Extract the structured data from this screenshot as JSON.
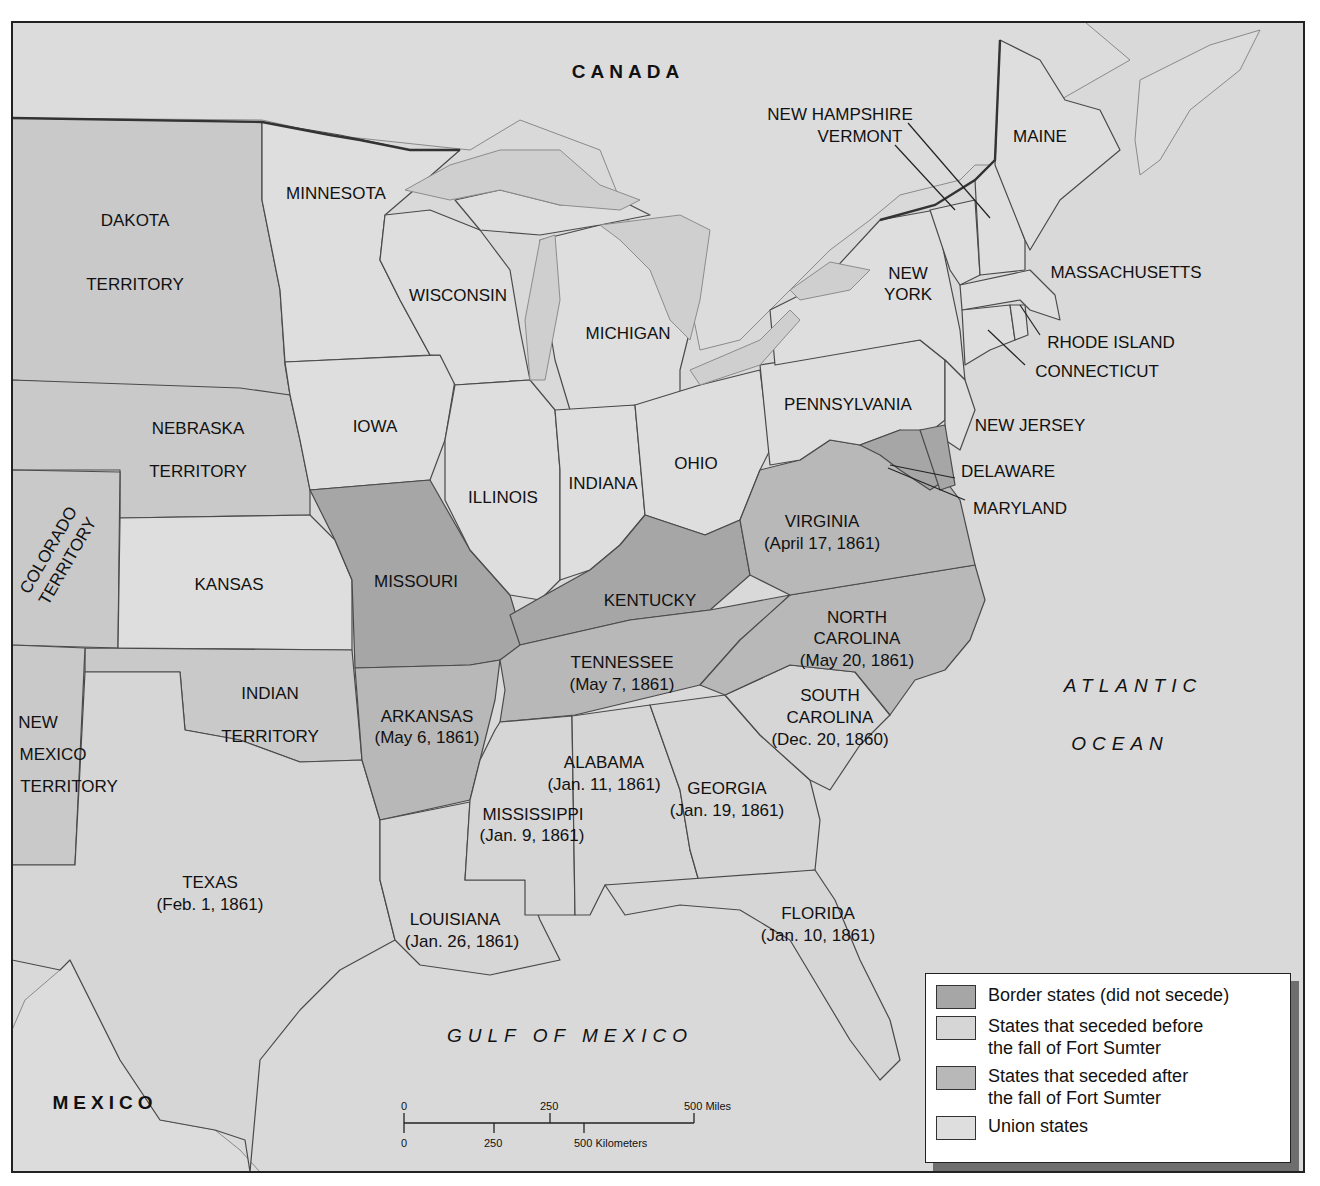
{
  "colors": {
    "border": "#a6a6a6",
    "seceded_before": "#d6d6d6",
    "seceded_after": "#b8b8b8",
    "union": "#dedede",
    "territory": "#c9c9c9",
    "water": "#d9d9d9"
  },
  "regions": {
    "canada": "CANADA",
    "mexico": "MEXICO",
    "atlantic_1": "ATLANTIC",
    "atlantic_2": "OCEAN",
    "gulf": "GULF OF MEXICO"
  },
  "states": {
    "dakota": [
      "DAKOTA",
      "TERRITORY"
    ],
    "nebraska": [
      "NEBRASKA",
      "TERRITORY"
    ],
    "colorado": [
      "COLORADO",
      "TERRITORY"
    ],
    "kansas": "KANSAS",
    "indian": [
      "INDIAN",
      "TERRITORY"
    ],
    "new_mexico": [
      "NEW",
      "MEXICO",
      "TERRITORY"
    ],
    "texas": [
      "TEXAS",
      "(Feb. 1, 1861)"
    ],
    "minnesota": "MINNESOTA",
    "iowa": "IOWA",
    "missouri": "MISSOURI",
    "arkansas": [
      "ARKANSAS",
      "(May 6, 1861)"
    ],
    "louisiana": [
      "LOUISIANA",
      "(Jan. 26, 1861)"
    ],
    "wisconsin": "WISCONSIN",
    "illinois": "ILLINOIS",
    "michigan": "MICHIGAN",
    "indiana": "INDIANA",
    "ohio": "OHIO",
    "kentucky": "KENTUCKY",
    "tennessee": [
      "TENNESSEE",
      "(May 7, 1861)"
    ],
    "mississippi": [
      "MISSISSIPPI",
      "(Jan. 9, 1861)"
    ],
    "alabama": [
      "ALABAMA",
      "(Jan. 11, 1861)"
    ],
    "georgia": [
      "GEORGIA",
      "(Jan. 19, 1861)"
    ],
    "florida": [
      "FLORIDA",
      "(Jan. 10, 1861)"
    ],
    "south_carolina": [
      "SOUTH",
      "CAROLINA",
      "(Dec. 20, 1860)"
    ],
    "north_carolina": [
      "NORTH",
      "CAROLINA",
      "(May 20, 1861)"
    ],
    "virginia": [
      "VIRGINIA",
      "(April 17, 1861)"
    ],
    "pennsylvania": "PENNSYLVANIA",
    "new_york": [
      "NEW",
      "YORK"
    ],
    "new_jersey": "NEW JERSEY",
    "delaware": "DELAWARE",
    "maryland": "MARYLAND",
    "new_hampshire": "NEW HAMPSHIRE",
    "vermont": "VERMONT",
    "maine": "MAINE",
    "massachusetts": "MASSACHUSETTS",
    "rhode_island": "RHODE ISLAND",
    "connecticut": "CONNECTICUT"
  },
  "legend": [
    {
      "label": "Border states (did not secede)",
      "key": "border"
    },
    {
      "label": "States that seceded before the fall of Fort Sumter",
      "line1": "States that seceded before",
      "line2": "the fall of Fort Sumter",
      "key": "seceded_before"
    },
    {
      "label": "States that seceded after the fall of Fort Sumter",
      "line1": "States that seceded after",
      "line2": "the fall of Fort Sumter",
      "key": "seceded_after"
    },
    {
      "label": "Union states",
      "key": "union"
    }
  ],
  "scale": {
    "miles": [
      "0",
      "250",
      "500 Miles"
    ],
    "km": [
      "0",
      "250",
      "500 Kilometers"
    ]
  }
}
